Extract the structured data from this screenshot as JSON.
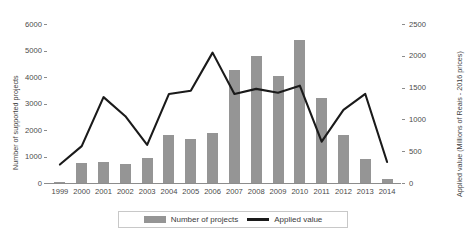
{
  "chart_data": {
    "type": "bar",
    "title": "",
    "subtitle": "",
    "xlabel": "",
    "ylabel": "Number of supported projects",
    "y2label": "Applied value (Millions of Reais - 2016 prices)",
    "categories": [
      "1999",
      "2000",
      "2001",
      "2002",
      "2003",
      "2004",
      "2005",
      "2006",
      "2007",
      "2008",
      "2009",
      "2010",
      "2011",
      "2012",
      "2013",
      "2014"
    ],
    "ylim": [
      0,
      6000
    ],
    "y2lim": [
      0,
      2500
    ],
    "yticks": [
      "0",
      "1000",
      "2000",
      "3000",
      "4000",
      "5000",
      "6000"
    ],
    "y2ticks": [
      "0",
      "500",
      "1000",
      "1500",
      "2000",
      "2500"
    ],
    "grid": false,
    "legend_position": "bottom",
    "series": [
      {
        "name": "Number of projects",
        "chart_type": "bar",
        "axis": "left",
        "color": "#959595",
        "values": [
          50,
          750,
          800,
          700,
          950,
          1800,
          1650,
          1900,
          4250,
          4800,
          4050,
          5400,
          3200,
          1800,
          900,
          150
        ]
      },
      {
        "name": "Applied value",
        "chart_type": "line",
        "axis": "right",
        "color": "#1a1a1a",
        "values": [
          290,
          580,
          1350,
          1050,
          600,
          1400,
          1450,
          2050,
          1400,
          1480,
          1420,
          1530,
          650,
          1150,
          1400,
          330
        ]
      }
    ]
  },
  "axes": {
    "left_title": "Number of supported projects",
    "right_title": "Applied value (Millions of Reais - 2016 prices)"
  },
  "legend": {
    "items": [
      {
        "label": "Number of projects",
        "marker": "bar-swatch"
      },
      {
        "label": "Applied value",
        "marker": "line-swatch"
      }
    ]
  }
}
